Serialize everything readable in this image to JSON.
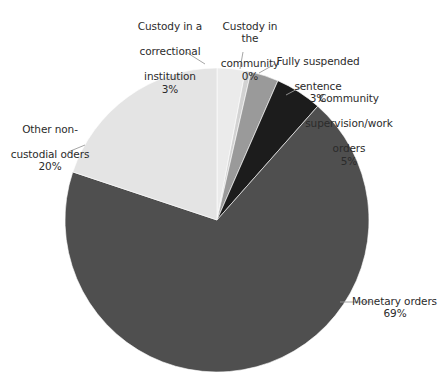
{
  "chart_data": {
    "type": "pie",
    "title": "",
    "subtitle": "",
    "xlabel": "",
    "ylabel": "",
    "legend_position": "none",
    "grid": false,
    "start_angle_deg": 0,
    "direction": "clockwise",
    "categories": [
      "Custody in a correctional institution",
      "Custody in the community",
      "Fully suspended sentence",
      "Community supervision/work orders",
      "Monetary orders",
      "Other non-custodial oders"
    ],
    "values": [
      3,
      0,
      3,
      5,
      69,
      20
    ],
    "value_labels": [
      "3%",
      "0%",
      "3%",
      "5%",
      "69%",
      "20%"
    ],
    "colors": [
      "#ebebeb",
      "#d2d2d2",
      "#9a9a9a",
      "#1c1c1c",
      "#4f4f4f",
      "#e4e4e4"
    ],
    "slices": [
      {
        "name": "Custody in a correctional institution",
        "label_line1": "Custody in a",
        "label_line2": "correctional",
        "label_line3": "institution",
        "value": 3,
        "value_label": "3%",
        "color": "#ebebeb"
      },
      {
        "name": "Custody in the community",
        "label_line1": "Custody in the",
        "label_line2": "community",
        "label_line3": "",
        "value": 0,
        "value_label": "0%",
        "color": "#d2d2d2"
      },
      {
        "name": "Fully suspended sentence",
        "label_line1": "Fully suspended",
        "label_line2": "sentence",
        "label_line3": "",
        "value": 3,
        "value_label": "3%",
        "color": "#9a9a9a"
      },
      {
        "name": "Community supervision/work orders",
        "label_line1": "Community",
        "label_line2": "supervision/work",
        "label_line3": "orders",
        "value": 5,
        "value_label": "5%",
        "color": "#1c1c1c"
      },
      {
        "name": "Monetary orders",
        "label_line1": "Monetary orders",
        "label_line2": "",
        "label_line3": "",
        "value": 69,
        "value_label": "69%",
        "color": "#4f4f4f"
      },
      {
        "name": "Other non-custodial oders",
        "label_line1": "Other non-",
        "label_line2": "custodial oders",
        "label_line3": "",
        "value": 20,
        "value_label": "20%",
        "color": "#e4e4e4"
      }
    ]
  },
  "geometry": {
    "center_x": 217,
    "center_y": 220,
    "radius": 152,
    "leader_color": "#9b9b9b"
  }
}
